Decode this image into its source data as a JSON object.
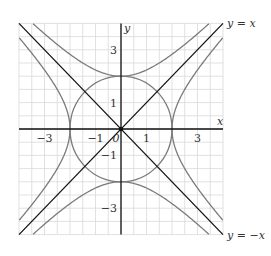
{
  "diagram": {
    "type": "coordinate-plot",
    "x_axis_label": "x",
    "y_axis_label": "y",
    "range": {
      "xmin": -4,
      "xmax": 4,
      "ymin": -4,
      "ymax": 4
    },
    "grid_step": 0.5,
    "x_tick_labels": [
      {
        "value": -3,
        "label": "−3"
      },
      {
        "value": -1,
        "label": "−1"
      },
      {
        "value": 0,
        "label": "0"
      },
      {
        "value": 1,
        "label": "1"
      },
      {
        "value": 3,
        "label": "3"
      }
    ],
    "y_tick_labels": [
      {
        "value": 3,
        "label": "3"
      },
      {
        "value": 1,
        "label": "1"
      },
      {
        "value": -1,
        "label": "−1"
      },
      {
        "value": -3,
        "label": "−3"
      }
    ],
    "curves": [
      {
        "name": "circle",
        "equation": "x^2 + y^2 = 4",
        "color": "#7a7a7a"
      },
      {
        "name": "hyperbola-vertical",
        "equation": "y^2 - x^2 = 4",
        "color": "#7a7a7a"
      },
      {
        "name": "hyperbola-horizontal",
        "equation": "x^2 - y^2 = 4",
        "color": "#7a7a7a"
      },
      {
        "name": "line-y-eq-x",
        "equation": "y = x",
        "label": "y = x",
        "color": "#111111"
      },
      {
        "name": "line-y-eq-neg-x",
        "equation": "y = -x",
        "label": "y = −x",
        "color": "#111111"
      }
    ],
    "colors": {
      "grid": "#d9d9d9",
      "axis": "#111111",
      "curve": "#7a7a7a",
      "line": "#111111"
    }
  }
}
